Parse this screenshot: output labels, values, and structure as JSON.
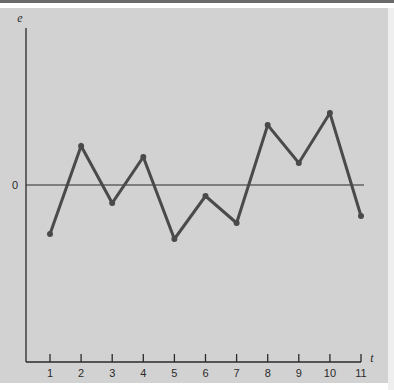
{
  "chart_data": {
    "type": "line",
    "title": "",
    "xlabel": "t",
    "ylabel": "e",
    "x": [
      1,
      2,
      3,
      4,
      5,
      6,
      7,
      8,
      9,
      10,
      11
    ],
    "categories": [
      "1",
      "2",
      "3",
      "4",
      "5",
      "6",
      "7",
      "8",
      "9",
      "10",
      "11"
    ],
    "series": [
      {
        "name": "e",
        "values": [
          -4.9,
          3.9,
          -1.8,
          2.8,
          -5.4,
          -1.1,
          -3.8,
          6.0,
          2.2,
          7.2,
          -3.1
        ]
      }
    ],
    "y_tick_labels": [
      "0"
    ],
    "reference_line": {
      "y": 0,
      "label": "0"
    },
    "ylim": [
      -17.7,
      15.7
    ],
    "xlim": [
      0.2,
      11
    ],
    "grid": false,
    "legend": null,
    "markers": true,
    "note": "y-axis has no numeric scale except 0; values are relative estimates"
  },
  "axes": {
    "y_label": "e",
    "x_label": "t",
    "zero_label": "0",
    "x_ticks": [
      "1",
      "2",
      "3",
      "4",
      "5",
      "6",
      "7",
      "8",
      "9",
      "10",
      "11"
    ]
  },
  "colors": {
    "background": "#d2d2d2",
    "line": "#4a4a4a",
    "axis": "#2a2a2a"
  }
}
